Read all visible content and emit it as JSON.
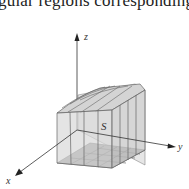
{
  "caption_fragment": "gular regions corresponding to th",
  "figure": {
    "axes": {
      "x_label": "x",
      "y_label": "y",
      "z_label": "z"
    },
    "solid_label": "S",
    "grid": {
      "rows": 4,
      "cols": 4
    },
    "colors": {
      "axis": "#333333",
      "solid_fill": "#d9d9d9",
      "solid_edge": "#666666",
      "base_fill": "#8c8c8c"
    }
  }
}
